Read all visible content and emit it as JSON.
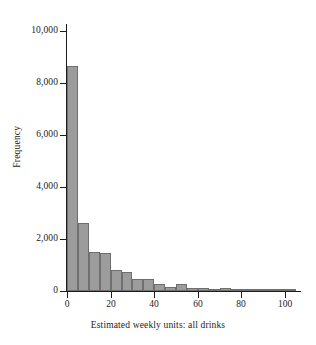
{
  "chart_data": {
    "type": "bar",
    "title": "",
    "subtitle": "",
    "xlabel": "Estimated weekly units: all drinks",
    "ylabel": "Frequency",
    "xlim": [
      0,
      105
    ],
    "ylim": [
      0,
      10000
    ],
    "grid": false,
    "legend": null,
    "bin_width": 5,
    "bar_color": "#9c9c9c",
    "bar_edge_color": "#6f6f6f",
    "axis_color": "#1c1c1c",
    "background_color": "#ffffff",
    "x_ticks": [
      {
        "value": 0,
        "label": "0"
      },
      {
        "value": 20,
        "label": "20"
      },
      {
        "value": 40,
        "label": "40"
      },
      {
        "value": 60,
        "label": "60"
      },
      {
        "value": 80,
        "label": "80"
      },
      {
        "value": 100,
        "label": "100"
      }
    ],
    "y_ticks": [
      {
        "value": 0,
        "label": "0"
      },
      {
        "value": 2000,
        "label": "2,000"
      },
      {
        "value": 4000,
        "label": "4,000"
      },
      {
        "value": 6000,
        "label": "6,000"
      },
      {
        "value": 8000,
        "label": "8,000"
      },
      {
        "value": 10000,
        "label": "10,000"
      }
    ],
    "bins": [
      {
        "x0": 0,
        "x1": 5,
        "center": 2.5,
        "value": 8650
      },
      {
        "x0": 5,
        "x1": 10,
        "center": 7.5,
        "value": 2630
      },
      {
        "x0": 10,
        "x1": 15,
        "center": 12.5,
        "value": 1500
      },
      {
        "x0": 15,
        "x1": 20,
        "center": 17.5,
        "value": 1470
      },
      {
        "x0": 20,
        "x1": 25,
        "center": 22.5,
        "value": 820
      },
      {
        "x0": 25,
        "x1": 30,
        "center": 27.5,
        "value": 730
      },
      {
        "x0": 30,
        "x1": 35,
        "center": 32.5,
        "value": 480
      },
      {
        "x0": 35,
        "x1": 40,
        "center": 37.5,
        "value": 470
      },
      {
        "x0": 40,
        "x1": 45,
        "center": 42.5,
        "value": 270
      },
      {
        "x0": 45,
        "x1": 50,
        "center": 47.5,
        "value": 150
      },
      {
        "x0": 50,
        "x1": 55,
        "center": 52.5,
        "value": 260
      },
      {
        "x0": 55,
        "x1": 60,
        "center": 57.5,
        "value": 120
      },
      {
        "x0": 60,
        "x1": 65,
        "center": 62.5,
        "value": 110
      },
      {
        "x0": 65,
        "x1": 70,
        "center": 67.5,
        "value": 60
      },
      {
        "x0": 70,
        "x1": 75,
        "center": 72.5,
        "value": 120
      },
      {
        "x0": 75,
        "x1": 80,
        "center": 77.5,
        "value": 40
      },
      {
        "x0": 80,
        "x1": 85,
        "center": 82.5,
        "value": 35
      },
      {
        "x0": 85,
        "x1": 90,
        "center": 87.5,
        "value": 20
      },
      {
        "x0": 90,
        "x1": 95,
        "center": 92.5,
        "value": 15
      },
      {
        "x0": 95,
        "x1": 100,
        "center": 97.5,
        "value": 10
      },
      {
        "x0": 100,
        "x1": 105,
        "center": 102.5,
        "value": 8
      }
    ],
    "categories": [
      "0-5",
      "5-10",
      "10-15",
      "15-20",
      "20-25",
      "25-30",
      "30-35",
      "35-40",
      "40-45",
      "45-50",
      "50-55",
      "55-60",
      "60-65",
      "65-70",
      "70-75",
      "75-80",
      "80-85",
      "85-90",
      "90-95",
      "95-100",
      "100-105"
    ],
    "values": [
      8650,
      2630,
      1500,
      1470,
      820,
      730,
      480,
      470,
      270,
      150,
      260,
      120,
      110,
      60,
      120,
      40,
      35,
      20,
      15,
      10,
      8
    ]
  }
}
